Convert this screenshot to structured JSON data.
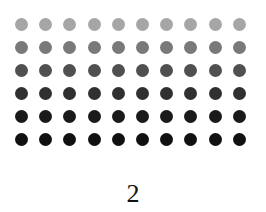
{
  "grid": {
    "columns": 10,
    "rows": [
      {
        "color": "#a6a6a6"
      },
      {
        "color": "#797979"
      },
      {
        "color": "#505050"
      },
      {
        "color": "#303030"
      },
      {
        "color": "#1a1a1a"
      },
      {
        "color": "#111111"
      }
    ]
  },
  "label": "2"
}
